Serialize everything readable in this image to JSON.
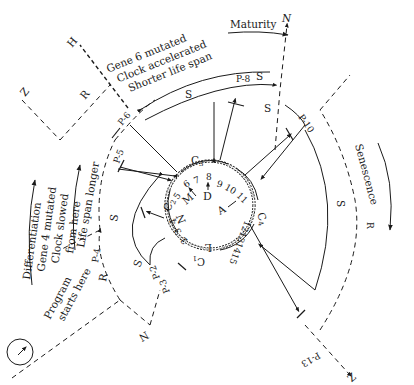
{
  "diagram": {
    "type": "life-cycle program clock",
    "labels": {
      "maturity": "Maturity",
      "senescence": "Senescence",
      "differentiation": "Differentiation",
      "gene4_line1": "Gene 4 mutated",
      "gene4_line2": "Clock slowed",
      "gene4_line3": "from here",
      "life_span_longer": "Life span longer",
      "gene6_line1": "Gene 6 mutated",
      "gene6_line2": "Clock accelerated",
      "gene6_line3": "Shorter life span",
      "program_line1": "Program",
      "program_line2": "starts here"
    },
    "points": {
      "p2": "P-2",
      "p3": "P-3",
      "p4": "P-4",
      "p5": "P-5",
      "p6": "P-6",
      "p8": "P-8",
      "p10": "P-10",
      "p13": "P-13"
    },
    "path_markers": {
      "N_top": "N",
      "N_left": "N",
      "Z_left": "Z",
      "Z_bottom": "Z",
      "H": "H",
      "R_left": "R",
      "R_lower": "R",
      "R_right": "R",
      "S_top_left": "S",
      "S_top": "S",
      "S_top_right": "S",
      "S_left": "S",
      "S_lower": "S",
      "S_right": "S"
    },
    "clock": {
      "cycles": [
        "C1",
        "C2",
        "C3",
        "C4"
      ],
      "genes": [
        "1",
        "2",
        "3",
        "4",
        "5",
        "6",
        "7",
        "8",
        "9",
        "10",
        "11",
        "12",
        "13",
        "14",
        "15"
      ],
      "inner_labels": {
        "M": "M",
        "D": "D",
        "A": "A",
        "N": "N",
        "L": "L"
      }
    }
  }
}
